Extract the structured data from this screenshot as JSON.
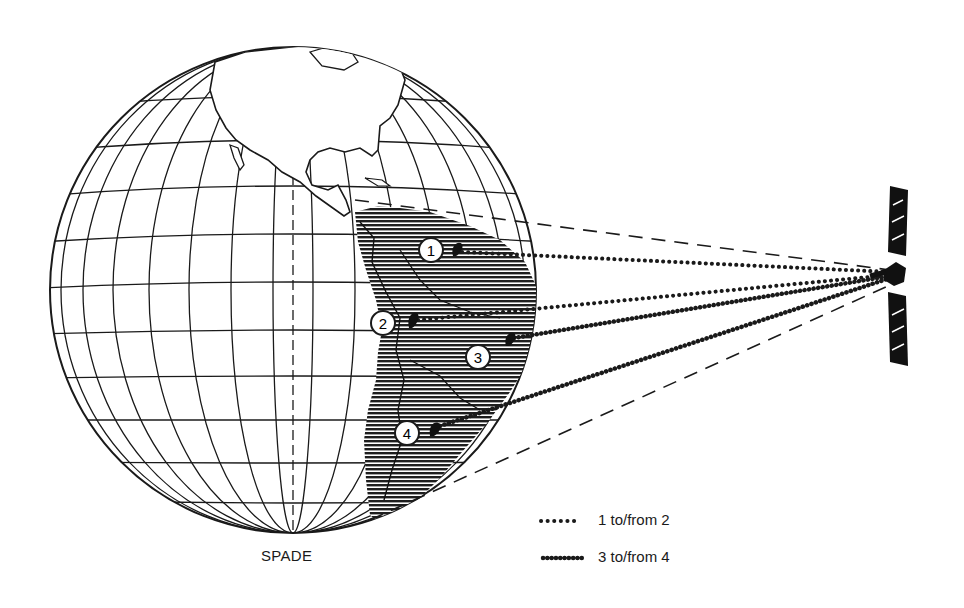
{
  "figure": {
    "caption": "SPADE",
    "satellite": {
      "name": "satellite",
      "position": [
        895,
        275
      ]
    },
    "globe": {
      "center": [
        293,
        290
      ],
      "radius": 243,
      "region_shown": "Americas"
    },
    "stations": [
      {
        "id": "1",
        "label": "1",
        "position": [
          431,
          250
        ],
        "antenna": [
          458,
          250
        ]
      },
      {
        "id": "2",
        "label": "2",
        "position": [
          383,
          323
        ],
        "antenna": [
          413,
          320
        ]
      },
      {
        "id": "3",
        "label": "3",
        "position": [
          478,
          357
        ],
        "antenna": [
          511,
          341
        ]
      },
      {
        "id": "4",
        "label": "4",
        "position": [
          407,
          433
        ],
        "antenna": [
          435,
          428
        ]
      }
    ],
    "links": [
      {
        "from": "1",
        "style": "dotted"
      },
      {
        "from": "2",
        "style": "dotted"
      },
      {
        "from": "3",
        "style": "beaded"
      },
      {
        "from": "4",
        "style": "beaded"
      }
    ],
    "coverage_beam": {
      "style": "dashed"
    }
  },
  "legend": {
    "items": [
      {
        "style": "dotted",
        "label": "1 to/from 2"
      },
      {
        "style": "beaded",
        "label": "3 to/from 4"
      }
    ]
  },
  "colors": {
    "ink": "#1a1a1a",
    "paper": "#ffffff",
    "shade": "#2a2a2a"
  }
}
